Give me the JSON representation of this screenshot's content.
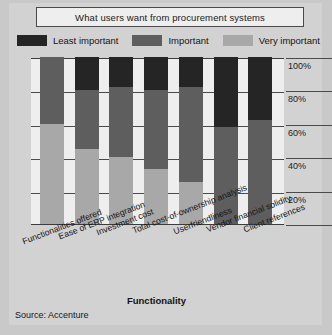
{
  "chart_data": {
    "type": "bar",
    "subtype": "stacked-percentage-column",
    "title": "What users want from procurement systems",
    "xlabel": "Functionality",
    "ylabel": "",
    "ylim": [
      0,
      100
    ],
    "yticks": [
      "20%",
      "40%",
      "60%",
      "80%",
      "100%"
    ],
    "ytick_values": [
      20,
      40,
      60,
      80,
      100
    ],
    "grid": true,
    "legend_position": "top",
    "source": "Source: Accenture",
    "categories": [
      "Functionalities offered",
      "Ease of ERP integration",
      "Investment cost",
      "Total cost-of-ownership analysis",
      "Userfriendliness",
      "Vendor financial solidity",
      "Client references"
    ],
    "series": [
      {
        "name": "Very important",
        "color": "#a8a8a8",
        "values": [
          60,
          45,
          40,
          33,
          25,
          0,
          0
        ]
      },
      {
        "name": "Important",
        "color": "#5e5e5e",
        "values": [
          40,
          35,
          42,
          47,
          57,
          58,
          62
        ]
      },
      {
        "name": "Least important",
        "color": "#252525",
        "values": [
          0,
          20,
          18,
          20,
          18,
          42,
          38
        ]
      }
    ]
  },
  "title": {
    "text": "What users want from procurement systems"
  },
  "legend": {
    "items": [
      {
        "label": "Least important",
        "color": "#252525",
        "swatch_name": "legend-swatch-least-important"
      },
      {
        "label": "Important",
        "color": "#5e5e5e",
        "swatch_name": "legend-swatch-important"
      },
      {
        "label": "Very important",
        "color": "#a8a8a8",
        "swatch_name": "legend-swatch-very-important"
      }
    ]
  },
  "axes": {
    "yticks": [
      "100%",
      "80%",
      "60%",
      "40%",
      "20%"
    ],
    "x_title": "Functionality",
    "xlabels": [
      "Functionalities offered",
      "Ease of ERP integration",
      "Investment cost",
      "Total cost-of-ownership analysis",
      "Userfriendliness",
      "Vendor financial solidity",
      "Client references"
    ]
  },
  "footer": {
    "source": "Source: Accenture"
  },
  "colors": {
    "least_important": "#252525",
    "important": "#5e5e5e",
    "very_important": "#a8a8a8",
    "figure_background": "#d2d2d2",
    "plot_background": "#eeeeee",
    "axis": "#3c3c3c"
  }
}
